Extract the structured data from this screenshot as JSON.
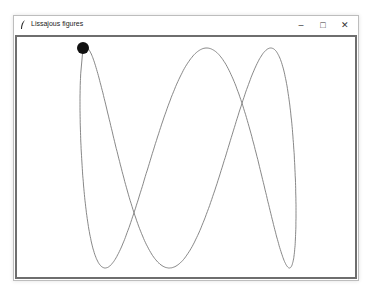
{
  "window": {
    "title": "Lissajous figures",
    "icon": "feather-icon",
    "controls": {
      "minimize": "–",
      "maximize": "□",
      "close": "✕"
    }
  },
  "canvas": {
    "background": "#ffffff",
    "line_color": "#7a7a7a",
    "pen_color": "#111111",
    "curve": {
      "center_x": 188,
      "center_y": 158,
      "amp_x": 108,
      "amp_y": 110,
      "freq_x": 1,
      "freq_y": 3,
      "phase": 0.35,
      "t_start": 0.0,
      "t_end": 6.05,
      "steps": 600
    },
    "pen": {
      "x": 83,
      "y": 48,
      "r": 6
    }
  }
}
